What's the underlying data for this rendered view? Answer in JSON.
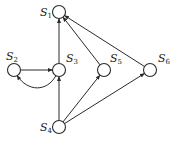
{
  "diagram": {
    "type": "directed-graph",
    "nodes": [
      {
        "id": "S1",
        "base": "S",
        "sub": "1",
        "x": 59,
        "y": 12,
        "label_x": 40,
        "label_y": 16
      },
      {
        "id": "S2",
        "base": "S",
        "sub": "2",
        "x": 14,
        "y": 70,
        "label_x": 6,
        "label_y": 60
      },
      {
        "id": "S3",
        "base": "S",
        "sub": "3",
        "x": 59,
        "y": 70,
        "label_x": 66,
        "label_y": 62
      },
      {
        "id": "S5",
        "base": "S",
        "sub": "5",
        "x": 104,
        "y": 70,
        "label_x": 110,
        "label_y": 62
      },
      {
        "id": "S6",
        "base": "S",
        "sub": "6",
        "x": 150,
        "y": 70,
        "label_x": 158,
        "label_y": 62
      },
      {
        "id": "S4",
        "base": "S",
        "sub": "4",
        "x": 59,
        "y": 127,
        "label_x": 40,
        "label_y": 131
      }
    ],
    "edges": [
      {
        "from": "S2",
        "to": "S3",
        "curved": false
      },
      {
        "from": "S3",
        "to": "S2",
        "curved": true
      },
      {
        "from": "S3",
        "to": "S1",
        "curved": false
      },
      {
        "from": "S5",
        "to": "S1",
        "curved": false
      },
      {
        "from": "S6",
        "to": "S1",
        "curved": false
      },
      {
        "from": "S4",
        "to": "S3",
        "curved": false
      },
      {
        "from": "S4",
        "to": "S5",
        "curved": false
      },
      {
        "from": "S4",
        "to": "S6",
        "curved": false
      }
    ],
    "colors": {
      "stroke": "#2a2a2a",
      "background": "#ffffff"
    }
  }
}
